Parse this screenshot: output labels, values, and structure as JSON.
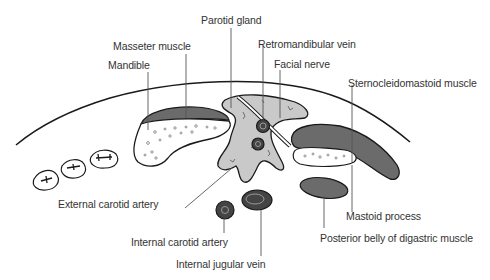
{
  "diagram": {
    "colors": {
      "gland_fill": "#c9c9c9",
      "muscle_fill": "#6b6b6b",
      "bone_fill": "#ffffff",
      "vessel_fill": "#444444",
      "outline": "#1a1a1a",
      "leader": "#555555",
      "text": "#333333"
    },
    "labels": {
      "parotid_gland": "Parotid gland",
      "masseter_muscle": "Masseter muscle",
      "retromandibular_vein": "Retromandibular vein",
      "mandible": "Mandible",
      "facial_nerve": "Facial nerve",
      "sternocleidomastoid_muscle": "Sternocleidomastoid muscle",
      "external_carotid_artery": "External carotid artery",
      "mastoid_process": "Mastoid process",
      "internal_carotid_artery": "Internal carotid artery",
      "posterior_belly_digastric": "Posterior belly of digastric muscle",
      "internal_jugular_vein": "Internal jugular vein"
    }
  }
}
